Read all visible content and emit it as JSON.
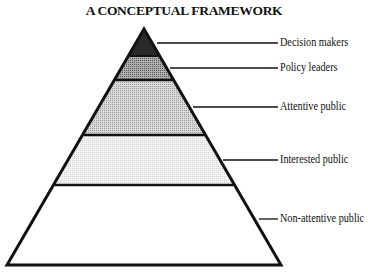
{
  "title": "A CONCEPTUAL FRAMEWORK",
  "pyramid": {
    "layers": [
      {
        "label": "Decision makers",
        "fill": "#2a2a2a"
      },
      {
        "label": "Policy leaders",
        "fill": "#8a8a8a"
      },
      {
        "label": "Attentive public",
        "fill": "#c4c4c4"
      },
      {
        "label": "Interested public",
        "fill": "#ececec"
      },
      {
        "label": "Non-attentive public",
        "fill": "#ffffff"
      }
    ]
  }
}
